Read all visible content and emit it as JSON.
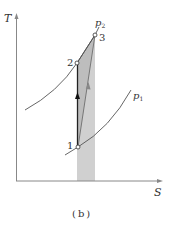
{
  "figure": {
    "caption": "(b)",
    "axes": {
      "y_label": "T",
      "x_label": "S"
    },
    "points": [
      {
        "id": "1",
        "label": "1"
      },
      {
        "id": "2",
        "label": "2"
      },
      {
        "id": "3",
        "label": "3"
      }
    ],
    "curves": [
      {
        "id": "p1",
        "label": "p",
        "subscript": "1"
      },
      {
        "id": "p2",
        "label": "p",
        "subscript": "2"
      }
    ],
    "colors": {
      "axis": "#888888",
      "curve": "#555555",
      "process_line": "#222222",
      "shaded_area": "#c8c8c8",
      "arrow_gray": "#888888"
    }
  }
}
